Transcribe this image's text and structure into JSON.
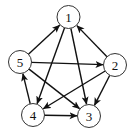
{
  "diagram": {
    "type": "directed-graph",
    "nodes": [
      {
        "id": "1",
        "label": "1",
        "x": 68.5,
        "y": 17
      },
      {
        "id": "2",
        "label": "2",
        "x": 115,
        "y": 65
      },
      {
        "id": "3",
        "label": "3",
        "x": 89,
        "y": 116
      },
      {
        "id": "4",
        "label": "4",
        "x": 33,
        "y": 115
      },
      {
        "id": "5",
        "label": "5",
        "x": 20,
        "y": 62
      }
    ],
    "edges": [
      {
        "from": "5",
        "to": "1"
      },
      {
        "from": "2",
        "to": "1"
      },
      {
        "from": "1",
        "to": "4"
      },
      {
        "from": "1",
        "to": "3"
      },
      {
        "from": "5",
        "to": "2"
      },
      {
        "from": "5",
        "to": "3"
      },
      {
        "from": "2",
        "to": "4"
      },
      {
        "from": "2",
        "to": "3"
      },
      {
        "from": "4",
        "to": "5"
      },
      {
        "from": "4",
        "to": "3"
      }
    ],
    "node_radius": 11.5,
    "colors": {
      "stroke": "#333333",
      "edge": "#111111",
      "background": "#ffffff"
    }
  }
}
